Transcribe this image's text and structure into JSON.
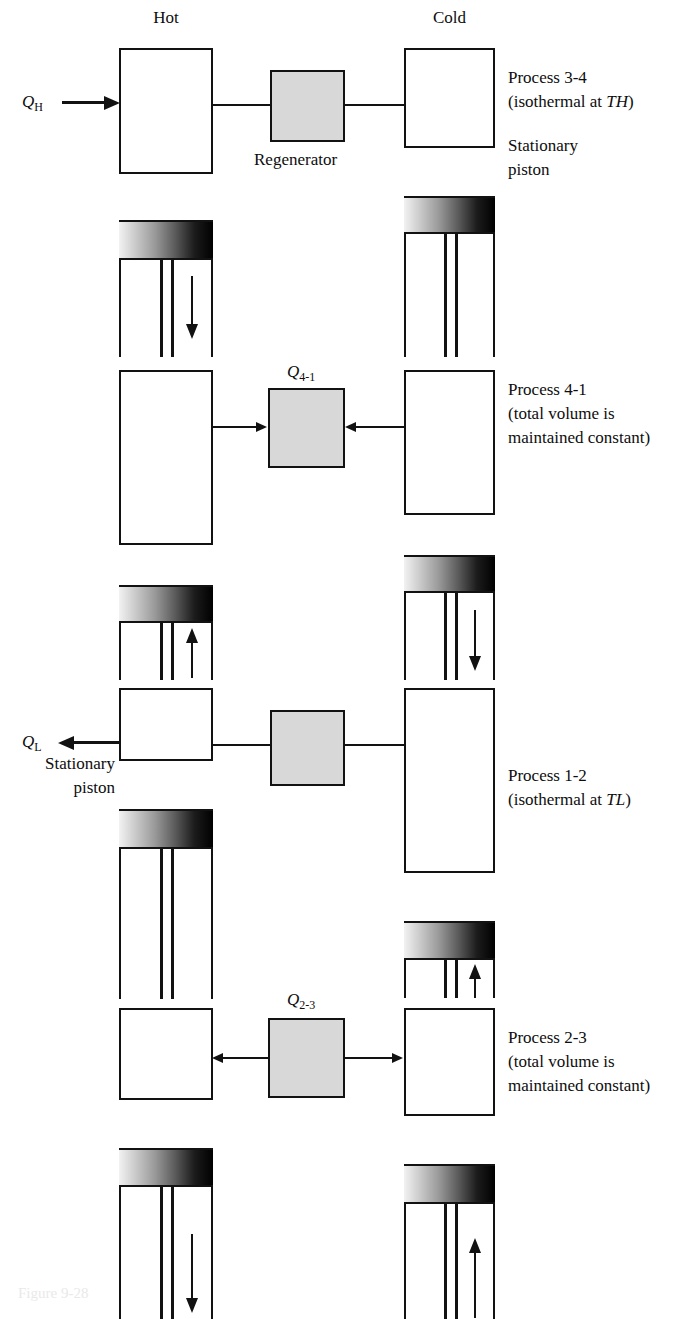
{
  "figure": {
    "caption_faint": "Figure 9-28",
    "column_labels": {
      "hot": "Hot",
      "cold": "Cold"
    },
    "regenerator_label": "Regenerator",
    "colors": {
      "ink": "#121212",
      "regenerator_fill": "#d8d8d8",
      "piston_light": "#f2f2f2",
      "piston_dark": "#000000",
      "background": "#ffffff"
    }
  },
  "panels": [
    {
      "id": "panel-3-4",
      "heat_label": {
        "symbol": "Q",
        "sub": "H",
        "visible": true
      },
      "regenerator_caption": "Regenerator",
      "flow_direction": "into-hot-cylinder",
      "notes": [
        {
          "line": "Process 3-4"
        },
        {
          "line": "(isothermal at T",
          "sub": "H",
          "tail": ")"
        },
        {
          "line": "Stationary"
        },
        {
          "line": "piston"
        }
      ],
      "note_lines": [
        "Process 3-4",
        "(isothermal at TH)",
        "Stationary",
        "piston"
      ],
      "hot_cylinder": {
        "piston_motion": "down",
        "piston_position": "mid"
      },
      "cold_cylinder": {
        "piston_motion": "none",
        "piston_position": "upper"
      }
    },
    {
      "id": "panel-4-1",
      "heat_label": {
        "symbol": "Q",
        "sub": "4-1",
        "visible": true
      },
      "flow_direction": "both-into-regenerator",
      "note_lines": [
        "Process 4-1",
        "(total volume is",
        "maintained constant)"
      ],
      "hot_cylinder": {
        "piston_motion": "up",
        "piston_position": "low"
      },
      "cold_cylinder": {
        "piston_motion": "down",
        "piston_position": "upper"
      }
    },
    {
      "id": "panel-1-2",
      "heat_label": {
        "symbol": "Q",
        "sub": "L",
        "visible": true
      },
      "flow_direction": "out-of-hot-cylinder",
      "note_lines": [
        "Process 1-2",
        "(isothermal at TL)",
        "Stationary",
        "piston"
      ],
      "hot_cylinder": {
        "piston_motion": "none",
        "piston_position": "top"
      },
      "cold_cylinder": {
        "piston_motion": "up",
        "piston_position": "low"
      }
    },
    {
      "id": "panel-2-3",
      "heat_label": {
        "symbol": "Q",
        "sub": "2-3",
        "visible": true
      },
      "flow_direction": "both-out-of-regenerator",
      "note_lines": [
        "Process 2-3",
        "(total volume is",
        "maintained constant)"
      ],
      "hot_cylinder": {
        "piston_motion": "down",
        "piston_position": "upper"
      },
      "cold_cylinder": {
        "piston_motion": "up",
        "piston_position": "upper"
      }
    }
  ],
  "text": {
    "hot": "Hot",
    "cold": "Cold",
    "regenerator": "Regenerator",
    "q_h_symbol": "Q",
    "q_h_sub": "H",
    "q_l_symbol": "Q",
    "q_l_sub": "L",
    "q_41_symbol": "Q",
    "q_41_sub": "4-1",
    "q_23_symbol": "Q",
    "q_23_sub": "2-3",
    "p1_line1": "Process 3-4",
    "p1_line2_a": "(isothermal at ",
    "p1_line2_t": "T",
    "p1_line2_sub": "H",
    "p1_line2_b": ")",
    "p1_line3": "Stationary",
    "p1_line4": "piston",
    "p2_line1": "Process 4-1",
    "p2_line2": "(total volume is",
    "p2_line3": "maintained constant)",
    "p3_line1": "Process 1-2",
    "p3_line2_a": "(isothermal at ",
    "p3_line2_t": "T",
    "p3_line2_sub": "L",
    "p3_line2_b": ")",
    "p3_stationary": "Stationary",
    "p3_piston": "piston",
    "p4_line1": "Process 2-3",
    "p4_line2": "(total volume is",
    "p4_line3": "maintained constant)",
    "caption_faint": "Figure 9-28"
  }
}
